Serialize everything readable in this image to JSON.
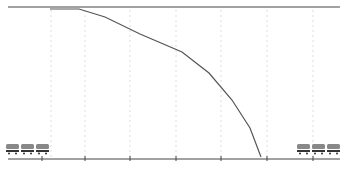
{
  "colors": {
    "background": "#ffffff",
    "line": "#555555",
    "grid": "#dddddd",
    "axis": "#444444",
    "train_body": "#888888",
    "train_detail": "#333333"
  },
  "top_line": {
    "x1": 8,
    "x2": 340,
    "y": 7
  },
  "axis_line": {
    "x1": 8,
    "x2": 340,
    "y": 159
  },
  "ticks_x": [
    42,
    85,
    130,
    176,
    221,
    267,
    313
  ],
  "grid_x": [
    51,
    85,
    130,
    176,
    221,
    267,
    313
  ],
  "curve_points": [
    [
      50,
      9
    ],
    [
      79,
      9
    ],
    [
      105,
      17
    ],
    [
      140,
      34
    ],
    [
      182,
      52
    ],
    [
      209,
      73
    ],
    [
      232,
      100
    ],
    [
      250,
      128
    ],
    [
      261,
      157
    ]
  ],
  "trains": [
    {
      "name": "train-left",
      "x": 6,
      "y": 144,
      "cars": 3
    },
    {
      "name": "train-right",
      "x": 297,
      "y": 144,
      "cars": 3
    }
  ]
}
